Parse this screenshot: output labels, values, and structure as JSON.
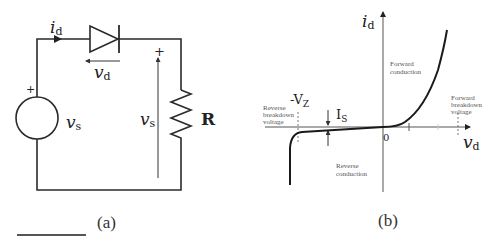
{
  "figure_a": {
    "caption": "(a)",
    "current_label": "i",
    "current_sub": "d",
    "diode_voltage_label": "v",
    "diode_voltage_sub": "d",
    "source_label": "v",
    "source_sub": "s",
    "source_plus": "+",
    "load_voltage_label": "v",
    "load_voltage_sub": "s",
    "load_plus": "+",
    "resistor_label": "R"
  },
  "figure_b": {
    "caption": "(b)",
    "y_axis_label": "i",
    "y_axis_sub": "d",
    "x_axis_label": "v",
    "x_axis_sub": "d",
    "origin_label": "0",
    "zener_label": "-V",
    "zener_sub": "Z",
    "saturation_label": "I",
    "saturation_sub": "S",
    "forward_conduction": [
      "Forward",
      "conduction"
    ],
    "reverse_conduction": [
      "Reverse",
      "conduction"
    ],
    "reverse_breakdown": [
      "Reverse",
      "breakdown",
      "voltage"
    ],
    "forward_breakdown": [
      "Forward",
      "breakdown",
      "voltage"
    ]
  }
}
